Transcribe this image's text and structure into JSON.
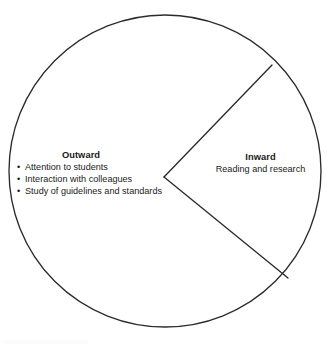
{
  "figure": {
    "type": "diagram",
    "subtype": "divided-circle",
    "background_color": "#ffffff",
    "stroke_color": "#2b2b2b",
    "geometry": {
      "circle_center_x": 165,
      "circle_center_y": 171,
      "circle_radius": 156,
      "wedge_apex_x": 164,
      "wedge_apex_y": 177,
      "wedge_upper_end_x": 272,
      "wedge_upper_end_y": 65,
      "wedge_lower_end_x": 288,
      "wedge_lower_end_y": 278
    },
    "sectors": [
      {
        "id": "outward",
        "heading": "Outward",
        "bullet_char": "•",
        "items": [
          "Attention to students",
          "Interaction with colleagues",
          "Study of guidelines and standards"
        ]
      },
      {
        "id": "inward",
        "heading": "Inward",
        "subtext": "Reading and research",
        "items": []
      }
    ]
  }
}
